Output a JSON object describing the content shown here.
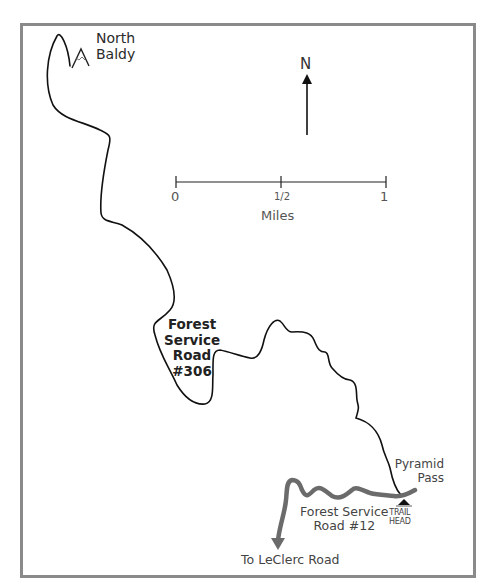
{
  "map": {
    "title": "Trail map: North Baldy via Forest Service Road #306",
    "frame_color": "#8a8a8a",
    "trail_color": "#111111",
    "road_color": "#6b6b6b",
    "labels": {
      "peak": [
        "North",
        "Baldy"
      ],
      "trail_road": [
        "Forest",
        "Service",
        "Road",
        "#306"
      ],
      "pass": [
        "Pyramid",
        "Pass"
      ],
      "access_road": [
        "Forest Service",
        "Road #12"
      ],
      "trailhead": [
        "TRAIL",
        "HEAD"
      ],
      "exit_road": "To LeClerc Road"
    },
    "compass": {
      "label": "N",
      "icon": "north-arrow-icon"
    },
    "scale_bar": {
      "ticks": [
        "0",
        "1/2",
        "1"
      ],
      "unit": "Miles"
    },
    "icons": {
      "peak": "mountain-peak-icon",
      "trailhead": "trailhead-triangle-icon",
      "exit_arrow": "arrow-down-icon"
    }
  }
}
